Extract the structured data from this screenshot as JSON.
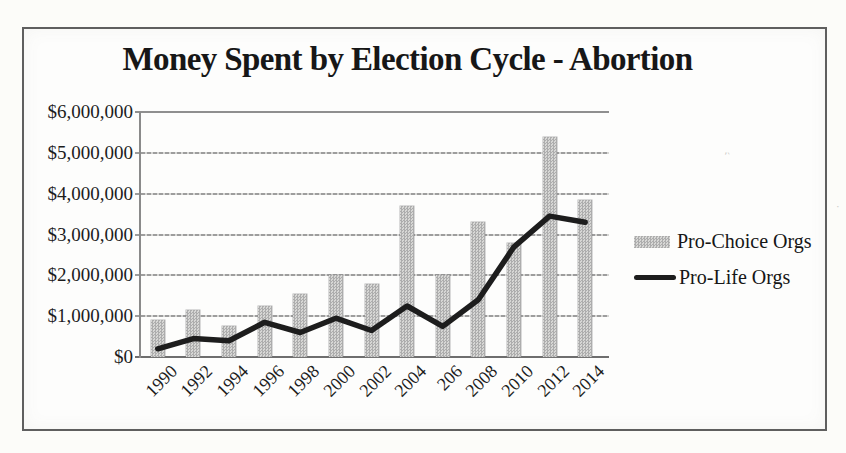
{
  "chart_data": {
    "type": "bar",
    "title": "Money Spent by Election Cycle - Abortion",
    "xlabel": "",
    "ylabel": "",
    "categories": [
      "1990",
      "1992",
      "1994",
      "1996",
      "1998",
      "2000",
      "2002",
      "2004",
      "206",
      "2008",
      "2010",
      "2012",
      "2014"
    ],
    "series": [
      {
        "name": "Pro-Choice Orgs",
        "type": "bar",
        "color": "#c2c2c2",
        "values": [
          900000,
          1150000,
          750000,
          1250000,
          1550000,
          2000000,
          1800000,
          3700000,
          2000000,
          3300000,
          2800000,
          5400000,
          3850000
        ]
      },
      {
        "name": "Pro-Life Orgs",
        "type": "line",
        "color": "#1d1d1d",
        "values": [
          200000,
          450000,
          400000,
          850000,
          600000,
          950000,
          650000,
          1250000,
          750000,
          1400000,
          2700000,
          3450000,
          3300000
        ]
      }
    ],
    "ylim": [
      0,
      6000000
    ],
    "ytick_interval": 1000000,
    "ytick_labels": [
      "$0",
      "$1,000,000",
      "$2,000,000",
      "$3,000,000",
      "$4,000,000",
      "$5,000,000",
      "$6,000,000"
    ],
    "grid": "horizontal",
    "legend_position": "right"
  }
}
